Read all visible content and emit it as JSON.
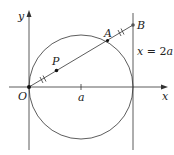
{
  "diagram": {
    "title": "",
    "axes": {
      "x_label": "x",
      "y_label": "y",
      "origin_label": "O",
      "tick_label": "a"
    },
    "points": {
      "O": "O",
      "P": "P",
      "A": "A",
      "B": "B"
    },
    "line_label_var": "x",
    "line_label_eq": " = 2",
    "line_label_a": "a",
    "colors": {
      "stroke": "#333333",
      "text": "#222222",
      "background": "#ffffff"
    }
  }
}
